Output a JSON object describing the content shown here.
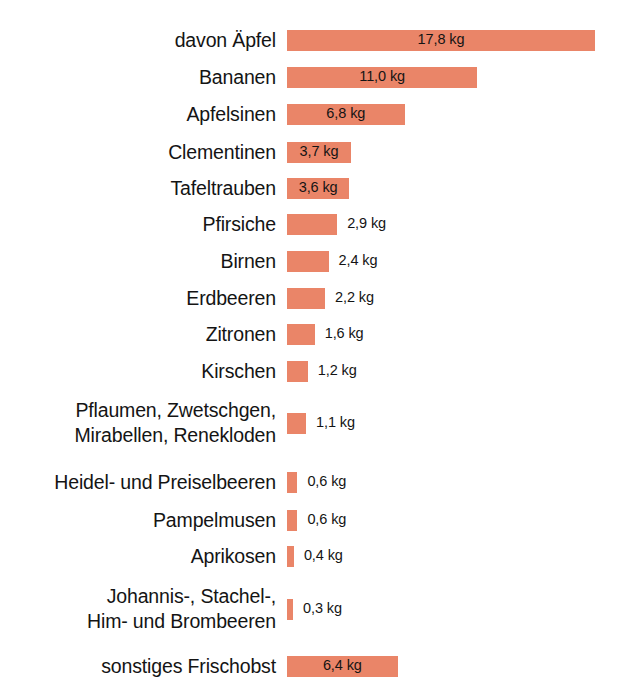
{
  "chart_data": {
    "type": "bar",
    "orientation": "horizontal",
    "title": "",
    "subtitle": "",
    "xlabel": "",
    "ylabel": "",
    "unit": "kg",
    "grid": false,
    "legend": false,
    "axis_visible": false,
    "xlim": [
      0,
      17.8
    ],
    "categories": [
      "davon Äpfel",
      "Bananen",
      "Apfelsinen",
      "Clementinen",
      "Tafeltrauben",
      "Pfirsiche",
      "Birnen",
      "Erdbeeren",
      "Zitronen",
      "Kirschen",
      "Pflaumen, Zwetschgen,\nMirabellen, Renekloden",
      "Heidel- und Preiselbeeren",
      "Pampelmusen",
      "Aprikosen",
      "Johannis-, Stachel-,\nHim- und Brombeeren",
      "sonstiges Frischobst"
    ],
    "values": [
      17.8,
      11.0,
      6.8,
      3.7,
      3.6,
      2.9,
      2.4,
      2.2,
      1.6,
      1.2,
      1.1,
      0.6,
      0.6,
      0.4,
      0.3,
      6.4
    ],
    "value_labels": [
      "17,8 kg",
      "11,0 kg",
      "6,8 kg",
      "3,7 kg",
      "3,6 kg",
      "2,9 kg",
      "2,4 kg",
      "2,2 kg",
      "1,6 kg",
      "1,2 kg",
      "1,1 kg",
      "0,6 kg",
      "0,6 kg",
      "0,4 kg",
      "0,3 kg",
      "6,4 kg"
    ],
    "label_placement": [
      "inside",
      "inside",
      "inside",
      "inside",
      "inside",
      "outside",
      "outside",
      "outside",
      "outside",
      "outside",
      "outside",
      "outside",
      "outside",
      "outside",
      "outside",
      "inside"
    ],
    "colors": {
      "bar": "#ea8568",
      "background": "#ffffff",
      "label_text": "#141414",
      "value_text": "#141414"
    }
  },
  "layout": {
    "bar_origin_x": 297,
    "px_per_kg": 17.3,
    "bar_height": 21,
    "row_positions": [
      {
        "top": 24,
        "height": 32
      },
      {
        "top": 61,
        "height": 32
      },
      {
        "top": 98,
        "height": 32
      },
      {
        "top": 136,
        "height": 32
      },
      {
        "top": 172,
        "height": 32
      },
      {
        "top": 208,
        "height": 32
      },
      {
        "top": 245,
        "height": 32
      },
      {
        "top": 282,
        "height": 32
      },
      {
        "top": 318,
        "height": 32
      },
      {
        "top": 355,
        "height": 32
      },
      {
        "top": 396,
        "height": 54
      },
      {
        "top": 466,
        "height": 32
      },
      {
        "top": 504,
        "height": 32
      },
      {
        "top": 540,
        "height": 32
      },
      {
        "top": 582,
        "height": 54
      },
      {
        "top": 650,
        "height": 32
      }
    ]
  }
}
